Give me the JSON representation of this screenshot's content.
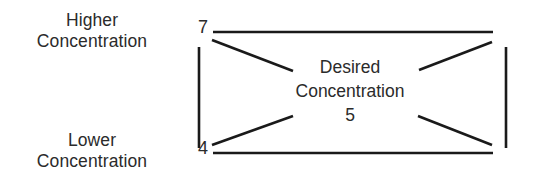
{
  "diagram": {
    "type": "tolerance-band-bowtie",
    "background_color": "#ffffff",
    "line_color": "#1a1a1a",
    "text_color": "#2b2b2b",
    "labels": {
      "higher_line1": "Higher",
      "higher_line2": "Concentration",
      "lower_line1": "Lower",
      "lower_line2": "Concentration",
      "center_line1": "Desired",
      "center_line2": "Concentration",
      "center_value": "5"
    },
    "axis_values": {
      "upper_bound": "7",
      "lower_bound": "4"
    },
    "geometry": {
      "top_rail": {
        "x1": 213,
        "y1": 32,
        "x2": 493,
        "y2": 32
      },
      "bottom_rail": {
        "x1": 213,
        "y1": 153,
        "x2": 493,
        "y2": 153
      },
      "left_bar": {
        "x1": 199,
        "y1": 47,
        "x2": 199,
        "y2": 148
      },
      "right_bar": {
        "x1": 506,
        "y1": 47,
        "x2": 506,
        "y2": 148
      },
      "diag_top_left": {
        "x1": 212,
        "y1": 40,
        "x2": 293,
        "y2": 71
      },
      "diag_bottom_left": {
        "x1": 212,
        "y1": 145,
        "x2": 293,
        "y2": 116
      },
      "diag_top_right": {
        "x1": 419,
        "y1": 70,
        "x2": 492,
        "y2": 42
      },
      "diag_bottom_right": {
        "x1": 418,
        "y1": 116,
        "x2": 492,
        "y2": 145
      },
      "stroke_width": 2.6
    }
  }
}
